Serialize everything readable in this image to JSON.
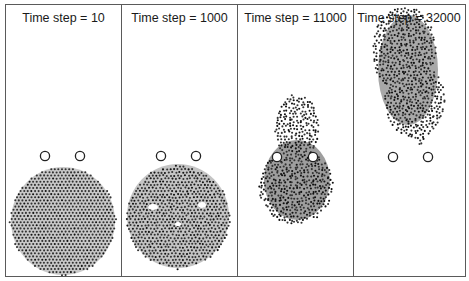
{
  "figure": {
    "colors": {
      "border": "#5a5a5a",
      "particle": "#333333",
      "particle_fill": "#bdbdbd",
      "background": "#ffffff",
      "obstacle": "#222222"
    },
    "panels": [
      {
        "title": "Time step = 10",
        "label": "panel-t10",
        "state": "regular hexagonal lattice disc below obstacles"
      },
      {
        "title": "Time step = 1000",
        "label": "panel-t1000",
        "state": "lattice deforming, folding near top"
      },
      {
        "title": "Time step = 11000",
        "label": "panel-t11000",
        "state": "aggregate engulfing obstacles, head protruding upward"
      },
      {
        "title": "Time step = 32000",
        "label": "panel-t32000",
        "state": "aggregate has passed obstacles, located near top"
      }
    ]
  }
}
